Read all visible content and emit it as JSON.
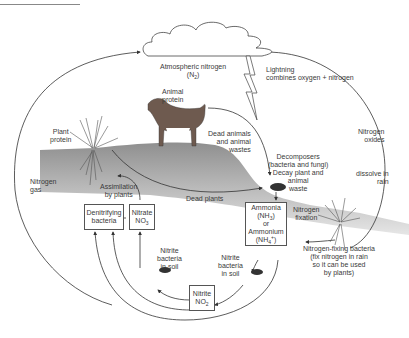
{
  "diagram": {
    "atmosphere": {
      "label": "Atmospheric nitrogen",
      "formula": "(N",
      "formula_sub": "2",
      "formula_end": ")"
    },
    "lightning": {
      "line1": "Lightning",
      "line2": "combines oxygen + nitrogen"
    },
    "animal_protein": {
      "line1": "Animal",
      "line2": "protein"
    },
    "plant_protein": {
      "line1": "Plant",
      "line2": "protein"
    },
    "dead_animals": {
      "line1": "Dead animals",
      "line2": "and animal",
      "line3": "wastes"
    },
    "nitrogen_oxides": {
      "line1": "Nitrogen",
      "line2": "oxides"
    },
    "dissolve_rain": {
      "line1": "dissolve in",
      "line2": "rain"
    },
    "decomposers": {
      "line1": "Decomposers",
      "line2": "(bacteria and fungi)",
      "line3": "Decay plant and",
      "line4": "animal",
      "line5": "waste"
    },
    "nitrogen_gas": {
      "line1": "Nitrogen",
      "line2": "gas"
    },
    "assimilation": {
      "line1": "Assimilation",
      "line2": "by plants"
    },
    "dead_plants": "Dead plants",
    "denitrifying": {
      "line1": "Denitrifying",
      "line2": "bacteria"
    },
    "nitrate": {
      "line1": "Nitrate",
      "line2": "NO",
      "sub": "3"
    },
    "ammonia": {
      "line1": "Ammonia",
      "line2": "(NH",
      "sub1": "3",
      "line2_end": ")",
      "line3": "or",
      "line4": "Ammonium",
      "line5": "(NH",
      "sub2": "4",
      "sup2": "+",
      "line5_end": ")"
    },
    "nitrogen_fixation": {
      "line1": "Nitrogen",
      "line2": "fixation"
    },
    "fixing_bacteria": {
      "line1": "Nitrogen-fixing bacteria",
      "line2": "(fix nitrogen in rain",
      "line3": "so it can be used",
      "line4": "by plants)"
    },
    "nitrite_bacteria_left": {
      "line1": "Nitrite",
      "line2": "bacteria",
      "line3": "in soil"
    },
    "nitrite_bacteria_right": {
      "line1": "Nitrite",
      "line2": "bacteria",
      "line3": "in soil"
    },
    "nitrite": {
      "line1": "Nitrite",
      "line2": "NO",
      "sub": "2"
    }
  }
}
